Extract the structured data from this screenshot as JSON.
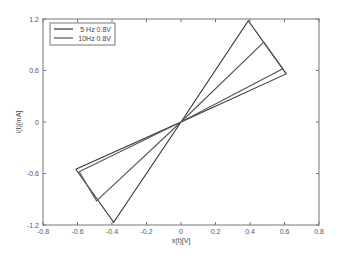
{
  "chart_data": {
    "type": "line",
    "title": "",
    "xlabel": "x(t)[V]",
    "ylabel": "i(t)[mA]",
    "xlim": [
      -0.8,
      0.8
    ],
    "ylim": [
      -1.2,
      1.2
    ],
    "xticks": [
      -0.8,
      -0.6,
      -0.4,
      -0.2,
      0,
      0.2,
      0.4,
      0.6,
      0.8
    ],
    "xtick_labels": [
      "-0.8",
      "-0.6",
      "-0.4",
      "-0.2",
      "0",
      "0.2",
      "0.4",
      "0.6",
      "0.8"
    ],
    "yticks": [
      -1.2,
      -0.6,
      0,
      0.6,
      1.2
    ],
    "ytick_labels": [
      "-1.2",
      "-0.6",
      "0",
      "0.6",
      "1.2"
    ],
    "grid": false,
    "legend_position": "upper left",
    "series": [
      {
        "name": "5 Hz 0.8V",
        "color": "#333333",
        "x": [
          -0.61,
          0.0,
          0.61,
          0.39,
          0.0,
          -0.39,
          -0.61
        ],
        "y": [
          -0.55,
          0.0,
          0.56,
          1.18,
          0.0,
          -1.17,
          -0.55
        ]
      },
      {
        "name": "10Hz 0.8V",
        "color": "#555555",
        "x": [
          -0.59,
          0.0,
          0.59,
          0.48,
          0.0,
          -0.49,
          -0.59
        ],
        "y": [
          -0.58,
          0.0,
          0.62,
          0.93,
          0.0,
          -0.92,
          -0.58
        ]
      }
    ]
  }
}
